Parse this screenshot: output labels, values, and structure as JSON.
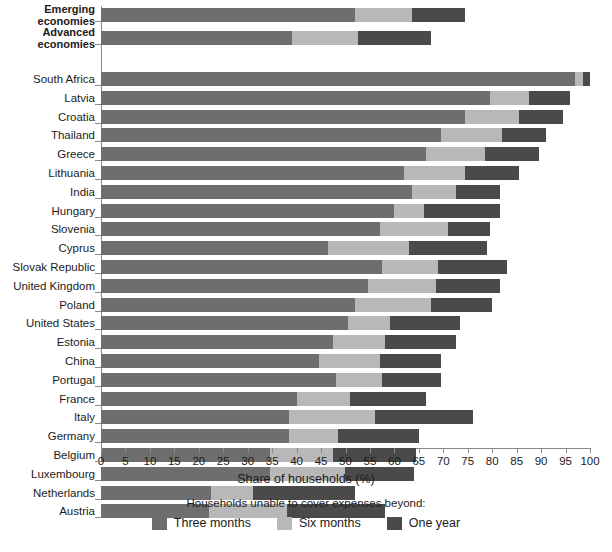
{
  "chart_data": {
    "type": "bar",
    "orientation": "horizontal",
    "stacked": true,
    "title": "",
    "xlabel": "Share of households (%)",
    "ylabel": "",
    "xlim": [
      0,
      100
    ],
    "xticks": [
      0,
      5,
      10,
      15,
      20,
      25,
      30,
      35,
      40,
      45,
      50,
      55,
      60,
      65,
      70,
      75,
      80,
      85,
      90,
      95,
      100
    ],
    "grid": false,
    "legend_position": "bottom",
    "legend_title": "Households unable to cover expenses beyond:",
    "series": [
      {
        "name": "Three months",
        "color": "#6e6e6e"
      },
      {
        "name": "Six months",
        "color": "#b8b8b8"
      },
      {
        "name": "One year",
        "color": "#4a4a4a"
      }
    ],
    "groups": [
      {
        "name": "aggregates",
        "bold": true,
        "categories": [
          "Emerging economies",
          "Advanced economies"
        ],
        "values": [
          [
            52.0,
            11.5,
            11.0
          ],
          [
            39.0,
            13.5,
            15.0
          ]
        ]
      },
      {
        "name": "countries",
        "bold": false,
        "categories": [
          "South Africa",
          "Latvia",
          "Croatia",
          "Thailand",
          "Greece",
          "Lithuania",
          "India",
          "Hungary",
          "Slovenia",
          "Cyprus",
          "Slovak Republic",
          "United Kingdom",
          "Poland",
          "United States",
          "Estonia",
          "China",
          "Portugal",
          "France",
          "Italy",
          "Germany",
          "Belgium",
          "Luxembourg",
          "Netherlands",
          "Austria"
        ],
        "values": [
          [
            97.0,
            1.5,
            1.5
          ],
          [
            79.5,
            8.0,
            8.5
          ],
          [
            74.5,
            11.0,
            9.0
          ],
          [
            69.5,
            12.5,
            9.0
          ],
          [
            66.5,
            12.0,
            11.0
          ],
          [
            62.0,
            12.5,
            11.0
          ],
          [
            63.5,
            9.0,
            9.0
          ],
          [
            60.0,
            6.0,
            15.5
          ],
          [
            57.0,
            14.0,
            8.5
          ],
          [
            46.5,
            16.5,
            16.0
          ],
          [
            57.5,
            11.5,
            14.0
          ],
          [
            54.5,
            14.0,
            13.0
          ],
          [
            52.0,
            15.5,
            12.5
          ],
          [
            50.5,
            8.5,
            14.5
          ],
          [
            47.5,
            10.5,
            14.5
          ],
          [
            44.5,
            12.5,
            12.5
          ],
          [
            48.0,
            9.5,
            12.0
          ],
          [
            40.0,
            11.0,
            15.5
          ],
          [
            38.5,
            17.5,
            20.0
          ],
          [
            38.5,
            10.0,
            16.5
          ],
          [
            34.5,
            13.0,
            17.0
          ],
          [
            34.5,
            15.5,
            14.0
          ],
          [
            22.5,
            8.5,
            21.0
          ],
          [
            22.0,
            16.0,
            20.0
          ]
        ]
      }
    ]
  }
}
